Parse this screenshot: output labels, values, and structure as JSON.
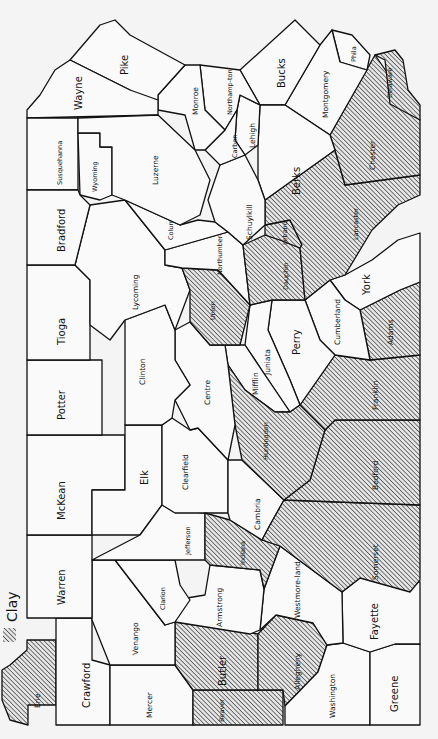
{
  "map": {
    "title": "Pennsylvania counties",
    "orientation": "rotated 90 degrees clockwise",
    "legend": {
      "symbol": "diagonal-hatch",
      "label": "Clay",
      "color": "#111111"
    },
    "counties": {
      "erie": {
        "label": "Erie",
        "clay": true
      },
      "crawford": {
        "label": "Crawford",
        "clay": false
      },
      "mercer": {
        "label": "Mercer",
        "clay": false
      },
      "beaver": {
        "label": "Beaver",
        "clay": true
      },
      "butler": {
        "label": "Butler",
        "clay": true
      },
      "allegheny": {
        "label": "Allegheny",
        "clay": true
      },
      "washington": {
        "label": "Washington",
        "clay": false
      },
      "greene": {
        "label": "Greene",
        "clay": false
      },
      "fayette": {
        "label": "Fayette",
        "clay": false
      },
      "westmoreland": {
        "label": "Westmore-land",
        "clay": false
      },
      "armstrong": {
        "label": "Armstrong",
        "clay": false
      },
      "venango": {
        "label": "Venango",
        "clay": false
      },
      "clarion": {
        "label": "Clarion",
        "clay": false
      },
      "warren": {
        "label": "Warren",
        "clay": false
      },
      "mckean": {
        "label": "McKean",
        "clay": false
      },
      "elk": {
        "label": "Elk",
        "clay": false
      },
      "jefferson": {
        "label": "Jefferson",
        "clay": false
      },
      "indiana": {
        "label": "Indiana",
        "clay": true
      },
      "cambria": {
        "label": "Cambria",
        "clay": false
      },
      "somerset": {
        "label": "Somerset",
        "clay": true
      },
      "bedford": {
        "label": "Bedford",
        "clay": true
      },
      "fulton": {
        "label": "",
        "clay": true
      },
      "franklin": {
        "label": "Franklin",
        "clay": true
      },
      "adams": {
        "label": "Adams",
        "clay": true
      },
      "york": {
        "label": "York",
        "clay": false
      },
      "cumberland": {
        "label": "Cumberland",
        "clay": false
      },
      "perry": {
        "label": "Perry",
        "clay": false
      },
      "juniata": {
        "label": "Juniata",
        "clay": false
      },
      "mifflin": {
        "label": "Mifflin",
        "clay": false
      },
      "huntingdon": {
        "label": "Huntingdon",
        "clay": true
      },
      "blair": {
        "label": "",
        "clay": true
      },
      "centre": {
        "label": "Centre",
        "clay": false
      },
      "clearfield": {
        "label": "Clearfield",
        "clay": false
      },
      "clinton": {
        "label": "Clinton",
        "clay": false
      },
      "potter": {
        "label": "Potter",
        "clay": false
      },
      "tioga": {
        "label": "Tioga",
        "clay": false
      },
      "lycoming": {
        "label": "Lycoming",
        "clay": false
      },
      "union": {
        "label": "Union",
        "clay": true
      },
      "snyder": {
        "label": "",
        "clay": true
      },
      "northumberland": {
        "label": "Northumber-land",
        "clay": false
      },
      "columbia": {
        "label": "Colum-bia",
        "clay": false
      },
      "montour": {
        "label": "",
        "clay": false
      },
      "dauphin": {
        "label": "Dauphin",
        "clay": true
      },
      "lebanon": {
        "label": "Lebanon",
        "clay": true
      },
      "lancaster": {
        "label": "Lancaster",
        "clay": true
      },
      "chester": {
        "label": "Chester",
        "clay": true
      },
      "delaware": {
        "label": "Delaware",
        "clay": true
      },
      "philadelphia": {
        "label": "Phila",
        "clay": false
      },
      "montgomery": {
        "label": "Montgomery",
        "clay": false
      },
      "bucks": {
        "label": "Bucks",
        "clay": false
      },
      "berks": {
        "label": "Berks",
        "clay": false
      },
      "schuylkill": {
        "label": "Schuylkill",
        "clay": false
      },
      "lehigh": {
        "label": "Lehigh",
        "clay": false
      },
      "northampton": {
        "label": "Northamp-ton",
        "clay": false
      },
      "carbon": {
        "label": "Carbon",
        "clay": false
      },
      "monroe": {
        "label": "Monroe",
        "clay": false
      },
      "pike": {
        "label": "Pike",
        "clay": false
      },
      "wayne": {
        "label": "Wayne",
        "clay": false
      },
      "susquehanna": {
        "label": "Susquehanna",
        "clay": false
      },
      "wyoming": {
        "label": "Wyoming",
        "clay": false
      },
      "luzerne": {
        "label": "Luzerne",
        "clay": false
      },
      "bradford": {
        "label": "Bradford",
        "clay": false
      }
    }
  }
}
